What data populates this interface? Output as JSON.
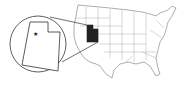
{
  "map": {
    "subject": "United States",
    "highlighted_state": "Utah",
    "inset_state": "Utah",
    "capital_marker": "star-icon",
    "colors": {
      "background": "#ffffff",
      "outline": "#555555",
      "highlight": "#222222",
      "inset_fill": "#ffffff"
    }
  }
}
